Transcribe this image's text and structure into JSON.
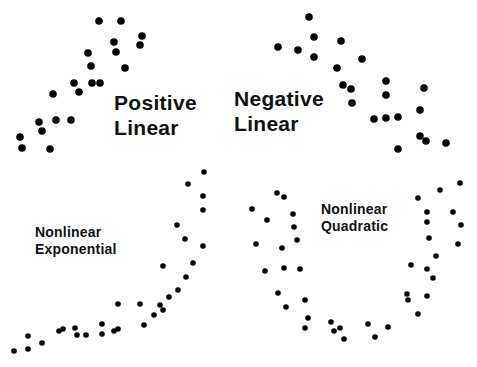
{
  "diagram": {
    "title": "",
    "dot_color": "#000000",
    "background": "#ffffff",
    "panels": [
      {
        "id": "positive-linear",
        "label_lines": [
          "Positive",
          "Linear"
        ],
        "label_pos": [
          114,
          90
        ],
        "label_size": "big",
        "dot_radius": 3.8,
        "points": [
          [
            99,
            21
          ],
          [
            121,
            21
          ],
          [
            142,
            36
          ],
          [
            140,
            45
          ],
          [
            114,
            42
          ],
          [
            116,
            52
          ],
          [
            88,
            53
          ],
          [
            91,
            66
          ],
          [
            125,
            68
          ],
          [
            74,
            83
          ],
          [
            92,
            83
          ],
          [
            100,
            83
          ],
          [
            79,
            92
          ],
          [
            53,
            94
          ],
          [
            39,
            122
          ],
          [
            56,
            120
          ],
          [
            71,
            120
          ],
          [
            42,
            131
          ],
          [
            20,
            137
          ],
          [
            22,
            148
          ],
          [
            50,
            149
          ]
        ]
      },
      {
        "id": "negative-linear",
        "label_lines": [
          "Negative",
          "Linear"
        ],
        "label_pos": [
          234,
          86
        ],
        "label_size": "big",
        "dot_radius": 3.8,
        "points": [
          [
            309,
            17
          ],
          [
            314,
            37
          ],
          [
            341,
            41
          ],
          [
            278,
            47
          ],
          [
            298,
            50
          ],
          [
            314,
            57
          ],
          [
            362,
            59
          ],
          [
            337,
            68
          ],
          [
            343,
            85
          ],
          [
            351,
            89
          ],
          [
            386,
            81
          ],
          [
            386,
            95
          ],
          [
            424,
            88
          ],
          [
            352,
            103
          ],
          [
            374,
            119
          ],
          [
            386,
            118
          ],
          [
            398,
            117
          ],
          [
            420,
            110
          ],
          [
            420,
            136
          ],
          [
            426,
            141
          ],
          [
            446,
            143
          ],
          [
            398,
            149
          ]
        ]
      },
      {
        "id": "nonlinear-exponential",
        "label_lines": [
          "Nonlinear",
          "Exponential"
        ],
        "label_pos": [
          35,
          224
        ],
        "label_size": "small",
        "dot_radius": 2.8,
        "points": [
          [
            204,
            172
          ],
          [
            188,
            184
          ],
          [
            203,
            196
          ],
          [
            203,
            210
          ],
          [
            177,
            225
          ],
          [
            185,
            239
          ],
          [
            203,
            246
          ],
          [
            163,
            266
          ],
          [
            193,
            263
          ],
          [
            186,
            277
          ],
          [
            178,
            290
          ],
          [
            169,
            297
          ],
          [
            163,
            310
          ],
          [
            140,
            304
          ],
          [
            160,
            305
          ],
          [
            154,
            315
          ],
          [
            144,
            325
          ],
          [
            118,
            304
          ],
          [
            118,
            329
          ],
          [
            28,
            336
          ],
          [
            14,
            351
          ],
          [
            28,
            349
          ],
          [
            42,
            343
          ],
          [
            59,
            331
          ],
          [
            63,
            329
          ],
          [
            75,
            328
          ],
          [
            77,
            335
          ],
          [
            86,
            335
          ],
          [
            102,
            334
          ],
          [
            102,
            324
          ],
          [
            114,
            331
          ]
        ]
      },
      {
        "id": "nonlinear-quadratic",
        "label_lines": [
          "Nonlinear",
          "Quadratic"
        ],
        "label_pos": [
          321,
          201
        ],
        "label_size": "small",
        "dot_radius": 2.8,
        "points": [
          [
            277,
            193
          ],
          [
            284,
            197
          ],
          [
            252,
            209
          ],
          [
            267,
            220
          ],
          [
            293,
            214
          ],
          [
            294,
            227
          ],
          [
            297,
            240
          ],
          [
            256,
            244
          ],
          [
            282,
            248
          ],
          [
            265,
            271
          ],
          [
            284,
            268
          ],
          [
            300,
            269
          ],
          [
            278,
            293
          ],
          [
            286,
            307
          ],
          [
            305,
            300
          ],
          [
            308,
            318
          ],
          [
            305,
            328
          ],
          [
            331,
            322
          ],
          [
            334,
            331
          ],
          [
            340,
            328
          ],
          [
            344,
            339
          ],
          [
            368,
            324
          ],
          [
            375,
            337
          ],
          [
            388,
            327
          ],
          [
            418,
            198
          ],
          [
            440,
            190
          ],
          [
            460,
            183
          ],
          [
            427,
            212
          ],
          [
            453,
            212
          ],
          [
            427,
            222
          ],
          [
            461,
            225
          ],
          [
            429,
            238
          ],
          [
            458,
            244
          ],
          [
            436,
            256
          ],
          [
            411,
            265
          ],
          [
            427,
            269
          ],
          [
            433,
            278
          ],
          [
            407,
            294
          ],
          [
            408,
            300
          ],
          [
            427,
            296
          ],
          [
            418,
            314
          ]
        ]
      }
    ]
  }
}
